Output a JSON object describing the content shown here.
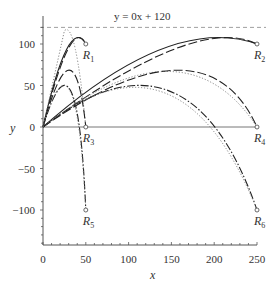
{
  "chart_data": {
    "type": "line",
    "title": "",
    "xlabel": "x",
    "ylabel": "y",
    "xlim": [
      0,
      250
    ],
    "ylim": [
      -142,
      128
    ],
    "xticks": [
      0,
      50,
      100,
      150,
      200,
      250
    ],
    "yticks": [
      -100,
      -50,
      0,
      50,
      100
    ],
    "x_tick_labels": [
      "0",
      "50",
      "100",
      "150",
      "200",
      "250"
    ],
    "y_tick_labels": [
      "−100",
      "−50",
      "0",
      "50",
      "100"
    ],
    "grid": false,
    "legend": null,
    "annotation": {
      "text": "y = 0x + 120",
      "line": {
        "y": 120,
        "style": "dashed",
        "x_range": [
          0,
          258
        ]
      }
    },
    "baseline": {
      "y": 0,
      "x_range": [
        0,
        250
      ],
      "style": "solid"
    },
    "points": [
      {
        "label": "R",
        "sub": "1",
        "x": 50,
        "y": 100
      },
      {
        "label": "R",
        "sub": "2",
        "x": 250,
        "y": 100
      },
      {
        "label": "R",
        "sub": "3",
        "x": 50,
        "y": 0
      },
      {
        "label": "R",
        "sub": "4",
        "x": 250,
        "y": 0
      },
      {
        "label": "R",
        "sub": "5",
        "x": 50,
        "y": -100
      },
      {
        "label": "R",
        "sub": "6",
        "x": 250,
        "y": -100
      }
    ],
    "series": [
      {
        "name": "to R1 (solid)",
        "style": "solid",
        "points": [
          [
            0,
            0
          ],
          [
            30,
            120
          ],
          [
            50,
            100
          ]
        ]
      },
      {
        "name": "to R1 (dashed)",
        "style": "longdash",
        "points": [
          [
            0,
            0
          ],
          [
            33,
            120
          ],
          [
            50,
            100
          ]
        ]
      },
      {
        "name": "to R3 (dotted)",
        "style": "dotted",
        "points": [
          [
            0,
            0
          ],
          [
            25,
            116
          ],
          [
            38,
            120
          ],
          [
            50,
            0
          ]
        ]
      },
      {
        "name": "to R3 (dashed)",
        "style": "longdash",
        "points": [
          [
            0,
            0
          ],
          [
            36,
            120
          ],
          [
            50,
            0
          ]
        ]
      },
      {
        "name": "to R5 (dashdot)",
        "style": "dashdot",
        "points": [
          [
            0,
            0
          ],
          [
            40,
            120
          ],
          [
            50,
            -100
          ]
        ]
      },
      {
        "name": "to R5 (dotted)",
        "style": "dotted",
        "points": [
          [
            0,
            0
          ],
          [
            38,
            120
          ],
          [
            50,
            -100
          ]
        ]
      },
      {
        "name": "to R2 (solid)",
        "style": "solid",
        "points": [
          [
            0,
            0
          ],
          [
            150,
            120
          ],
          [
            250,
            100
          ]
        ]
      },
      {
        "name": "to R2 (dashed)",
        "style": "longdash",
        "points": [
          [
            0,
            0
          ],
          [
            180,
            120
          ],
          [
            250,
            100
          ]
        ]
      },
      {
        "name": "to R4 (dotted)",
        "style": "dotted",
        "points": [
          [
            0,
            0
          ],
          [
            165,
            117
          ],
          [
            250,
            0
          ]
        ]
      },
      {
        "name": "to R4 (dashed)",
        "style": "longdash",
        "points": [
          [
            0,
            0
          ],
          [
            190,
            120
          ],
          [
            250,
            0
          ]
        ]
      },
      {
        "name": "to R6 (dashdot)",
        "style": "dashdot",
        "points": [
          [
            0,
            0
          ],
          [
            170,
            120
          ],
          [
            250,
            -100
          ]
        ]
      },
      {
        "name": "to R6 (dotted)",
        "style": "dotted",
        "points": [
          [
            0,
            0
          ],
          [
            160,
            115
          ],
          [
            250,
            -100
          ]
        ]
      }
    ]
  },
  "colors": {
    "curve": "#222222",
    "axis": "#555555",
    "guide": "#888888",
    "baseline": "#777777",
    "marker_fill": "#ffffff"
  }
}
